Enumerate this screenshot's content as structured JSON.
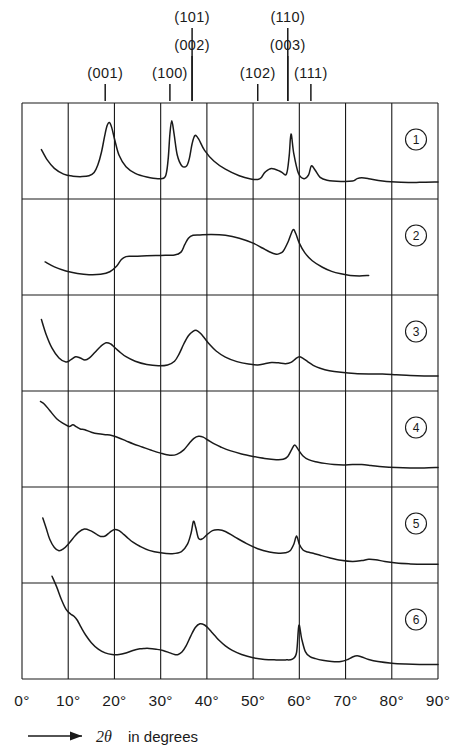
{
  "figure": {
    "type": "xrd-diffraction-patterns",
    "axis_caption_arrow": "⟶",
    "axis_caption_theta": "2θ",
    "axis_caption_text": "in degrees"
  },
  "hkl_markers": [
    {
      "label": "(001)",
      "x_deg": 18.0,
      "row": 2
    },
    {
      "label": "(100)",
      "x_deg": 32.0,
      "row": 2
    },
    {
      "label": "(101)",
      "x_deg": 36.8,
      "row": 0
    },
    {
      "label": "(002)",
      "x_deg": 36.8,
      "row": 1
    },
    {
      "label": "(102)",
      "x_deg": 51.0,
      "row": 2
    },
    {
      "label": "(110)",
      "x_deg": 57.5,
      "row": 0
    },
    {
      "label": "(003)",
      "x_deg": 57.5,
      "row": 1
    },
    {
      "label": "(111)",
      "x_deg": 62.5,
      "row": 2
    }
  ],
  "x_axis": {
    "label": "2θ in degrees",
    "min_deg": 0,
    "max_deg": 90,
    "tick_step_deg": 10,
    "tick_labels": [
      "0°",
      "10°",
      "20°",
      "30°",
      "40°",
      "50°",
      "60°",
      "70°",
      "80°",
      "90°"
    ],
    "tick_values": [
      0,
      10,
      20,
      30,
      40,
      50,
      60,
      70,
      80,
      90
    ]
  },
  "panels": [
    {
      "id": "1",
      "label": "1"
    },
    {
      "id": "2",
      "label": "2"
    },
    {
      "id": "3",
      "label": "3"
    },
    {
      "id": "4",
      "label": "4"
    },
    {
      "id": "5",
      "label": "5"
    },
    {
      "id": "6",
      "label": "6"
    }
  ],
  "chart_data": {
    "type": "line",
    "title": "",
    "xlabel": "2θ in degrees",
    "ylabel": "",
    "xlim": [
      0,
      90
    ],
    "ylim": [
      0,
      1
    ],
    "grid": true,
    "legend_position": "right-inside",
    "annotations": [
      "(001)",
      "(100)",
      "(101)",
      "(002)",
      "(102)",
      "(110)",
      "(003)",
      "(111)"
    ],
    "series": [
      {
        "name": "1",
        "x": [
          4.2,
          5.5,
          7.0,
          9.0,
          11.0,
          13.0,
          14.5,
          15.6,
          16.4,
          17.2,
          17.9,
          18.4,
          18.9,
          19.4,
          20.1,
          21.0,
          22.5,
          24.5,
          27.0,
          29.5,
          31.0,
          31.6,
          32.0,
          32.4,
          32.9,
          33.6,
          34.6,
          35.6,
          36.2,
          36.8,
          37.4,
          38.2,
          39.5,
          41.5,
          44.0,
          47.0,
          49.5,
          51.0,
          51.8,
          52.6,
          54.0,
          56.0,
          57.2,
          57.8,
          58.2,
          58.8,
          59.8,
          61.0,
          62.0,
          62.6,
          63.4,
          64.5,
          66.0,
          69.0,
          71.5,
          72.5,
          73.5,
          75.0,
          78.0,
          82.0,
          86.0,
          90.0
        ],
        "y": [
          0.53,
          0.4,
          0.3,
          0.23,
          0.205,
          0.2,
          0.21,
          0.25,
          0.34,
          0.5,
          0.7,
          0.82,
          0.86,
          0.8,
          0.64,
          0.46,
          0.32,
          0.24,
          0.195,
          0.175,
          0.2,
          0.4,
          0.72,
          0.88,
          0.72,
          0.46,
          0.33,
          0.33,
          0.42,
          0.6,
          0.7,
          0.66,
          0.52,
          0.39,
          0.29,
          0.21,
          0.17,
          0.165,
          0.19,
          0.255,
          0.3,
          0.26,
          0.23,
          0.45,
          0.72,
          0.48,
          0.24,
          0.175,
          0.22,
          0.33,
          0.28,
          0.19,
          0.155,
          0.14,
          0.145,
          0.175,
          0.185,
          0.175,
          0.145,
          0.13,
          0.13,
          0.135
        ]
      },
      {
        "name": "2",
        "x": [
          5.0,
          7.0,
          9.5,
          12.0,
          14.5,
          17.0,
          19.0,
          20.5,
          21.5,
          22.5,
          23.5,
          25.0,
          27.0,
          30.0,
          33.0,
          34.4,
          35.2,
          36.0,
          37.0,
          38.5,
          41.0,
          44.0,
          47.0,
          50.0,
          52.0,
          53.5,
          55.0,
          55.8,
          56.5,
          57.6,
          58.6,
          59.2,
          60.0,
          61.2,
          62.8,
          65.0,
          67.0,
          69.0,
          71.0,
          73.0,
          75.0
        ],
        "y": [
          0.33,
          0.27,
          0.22,
          0.19,
          0.175,
          0.18,
          0.21,
          0.28,
          0.36,
          0.395,
          0.4,
          0.4,
          0.405,
          0.41,
          0.415,
          0.45,
          0.54,
          0.62,
          0.655,
          0.66,
          0.665,
          0.655,
          0.62,
          0.56,
          0.5,
          0.455,
          0.425,
          0.435,
          0.46,
          0.58,
          0.72,
          0.68,
          0.56,
          0.44,
          0.345,
          0.265,
          0.215,
          0.185,
          0.165,
          0.16,
          0.165
        ]
      },
      {
        "name": "3",
        "x": [
          4.2,
          5.2,
          6.5,
          8.0,
          9.5,
          10.6,
          11.6,
          12.6,
          13.6,
          14.6,
          15.8,
          17.0,
          18.2,
          19.2,
          20.0,
          21.0,
          22.5,
          24.5,
          27.0,
          29.5,
          31.5,
          33.0,
          34.0,
          35.0,
          36.0,
          37.0,
          37.8,
          38.6,
          39.5,
          40.5,
          42.0,
          44.0,
          46.5,
          49.0,
          51.0,
          52.5,
          54.0,
          55.5,
          57.0,
          58.2,
          59.2,
          60.0,
          60.8,
          61.8,
          63.0,
          64.5,
          66.5,
          69.0,
          72.0,
          75.0,
          78.0,
          81.0,
          84.0,
          87.0,
          90.0
        ],
        "y": [
          0.8,
          0.62,
          0.45,
          0.33,
          0.28,
          0.31,
          0.345,
          0.33,
          0.305,
          0.33,
          0.4,
          0.47,
          0.515,
          0.5,
          0.46,
          0.41,
          0.345,
          0.29,
          0.25,
          0.235,
          0.245,
          0.29,
          0.38,
          0.5,
          0.6,
          0.655,
          0.665,
          0.63,
          0.57,
          0.5,
          0.415,
          0.34,
          0.285,
          0.255,
          0.245,
          0.26,
          0.275,
          0.27,
          0.26,
          0.275,
          0.32,
          0.345,
          0.325,
          0.285,
          0.24,
          0.205,
          0.175,
          0.155,
          0.14,
          0.135,
          0.135,
          0.125,
          0.115,
          0.11,
          0.11
        ]
      },
      {
        "name": "4",
        "x": [
          4.0,
          4.8,
          6.0,
          7.5,
          9.0,
          10.2,
          11.0,
          11.8,
          12.6,
          13.6,
          15.0,
          16.5,
          18.0,
          19.0,
          20.0,
          21.0,
          22.5,
          24.0,
          26.0,
          28.0,
          30.0,
          32.0,
          33.5,
          35.0,
          36.2,
          37.2,
          38.2,
          39.2,
          40.2,
          41.5,
          43.0,
          45.0,
          47.5,
          50.0,
          52.5,
          55.0,
          56.5,
          57.5,
          58.3,
          59.0,
          59.8,
          60.8,
          62.0,
          63.5,
          65.5,
          67.5,
          69.5,
          71.5,
          73.5,
          75.5,
          78.0,
          81.0,
          84.0,
          87.0,
          90.0
        ],
        "y": [
          0.97,
          0.94,
          0.86,
          0.76,
          0.7,
          0.665,
          0.685,
          0.66,
          0.635,
          0.625,
          0.595,
          0.575,
          0.565,
          0.56,
          0.545,
          0.525,
          0.49,
          0.455,
          0.415,
          0.375,
          0.34,
          0.315,
          0.325,
          0.38,
          0.46,
          0.52,
          0.545,
          0.535,
          0.5,
          0.455,
          0.415,
          0.37,
          0.33,
          0.3,
          0.275,
          0.26,
          0.265,
          0.3,
          0.38,
          0.44,
          0.38,
          0.305,
          0.26,
          0.235,
          0.215,
          0.2,
          0.195,
          0.2,
          0.2,
          0.19,
          0.175,
          0.165,
          0.16,
          0.16,
          0.165
        ]
      },
      {
        "name": "5",
        "x": [
          4.5,
          5.2,
          6.0,
          7.0,
          8.0,
          9.0,
          10.0,
          11.0,
          12.2,
          13.5,
          14.8,
          16.0,
          17.0,
          18.0,
          19.0,
          20.0,
          21.0,
          22.0,
          23.0,
          24.0,
          25.5,
          27.5,
          30.0,
          32.5,
          34.5,
          35.8,
          36.6,
          37.1,
          37.6,
          38.2,
          39.0,
          40.0,
          41.2,
          42.5,
          44.0,
          46.0,
          48.5,
          51.0,
          53.5,
          55.5,
          57.0,
          58.0,
          58.8,
          59.4,
          60.0,
          60.8,
          61.8,
          63.0,
          64.5,
          66.5,
          69.0,
          71.5,
          73.5,
          75.0,
          76.5,
          78.5,
          81.0,
          84.0,
          87.0,
          90.0
        ],
        "y": [
          0.72,
          0.6,
          0.46,
          0.36,
          0.32,
          0.345,
          0.4,
          0.47,
          0.545,
          0.585,
          0.565,
          0.525,
          0.495,
          0.5,
          0.545,
          0.58,
          0.565,
          0.52,
          0.47,
          0.425,
          0.375,
          0.325,
          0.295,
          0.285,
          0.31,
          0.4,
          0.54,
          0.68,
          0.6,
          0.47,
          0.465,
          0.515,
          0.565,
          0.575,
          0.555,
          0.49,
          0.41,
          0.345,
          0.305,
          0.29,
          0.295,
          0.32,
          0.4,
          0.5,
          0.4,
          0.33,
          0.305,
          0.29,
          0.265,
          0.235,
          0.205,
          0.19,
          0.2,
          0.215,
          0.21,
          0.19,
          0.17,
          0.16,
          0.155,
          0.155
        ]
      },
      {
        "name": "6",
        "x": [
          6.5,
          7.5,
          8.5,
          9.5,
          10.5,
          11.3,
          12.0,
          12.8,
          13.8,
          15.0,
          16.5,
          18.0,
          19.5,
          21.0,
          22.5,
          24.0,
          25.5,
          26.5,
          27.5,
          29.0,
          30.5,
          32.0,
          33.0,
          33.8,
          34.6,
          35.5,
          36.5,
          37.5,
          38.5,
          39.5,
          40.3,
          41.0,
          41.8,
          42.8,
          44.0,
          45.5,
          47.5,
          50.0,
          52.5,
          55.0,
          57.0,
          58.5,
          59.4,
          59.9,
          60.5,
          61.3,
          62.3,
          63.5,
          65.0,
          67.0,
          69.0,
          70.5,
          71.5,
          72.5,
          73.5,
          75.0,
          77.0,
          80.0,
          83.0,
          86.0,
          90.0
        ],
        "y": [
          1.18,
          1.05,
          0.9,
          0.78,
          0.72,
          0.69,
          0.64,
          0.555,
          0.46,
          0.37,
          0.29,
          0.245,
          0.225,
          0.225,
          0.245,
          0.275,
          0.295,
          0.3,
          0.3,
          0.29,
          0.275,
          0.245,
          0.225,
          0.225,
          0.255,
          0.33,
          0.45,
          0.555,
          0.6,
          0.585,
          0.545,
          0.5,
          0.45,
          0.39,
          0.33,
          0.275,
          0.225,
          0.185,
          0.165,
          0.16,
          0.16,
          0.17,
          0.25,
          0.58,
          0.42,
          0.26,
          0.2,
          0.175,
          0.155,
          0.14,
          0.14,
          0.165,
          0.195,
          0.21,
          0.195,
          0.165,
          0.14,
          0.12,
          0.11,
          0.105,
          0.105
        ]
      }
    ]
  }
}
